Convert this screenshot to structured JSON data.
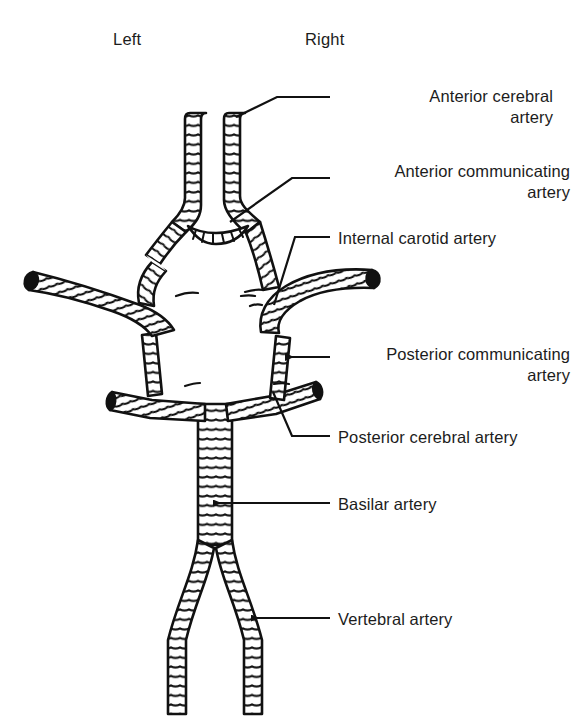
{
  "figure": {
    "title_visible": false,
    "orientation_labels": {
      "left": "Left",
      "right": "Right"
    },
    "ink_color": "#111111",
    "background_color": "#ffffff"
  },
  "callouts": [
    {
      "id": "anterior-cerebral-artery",
      "label": "Anterior cerebral\nartery",
      "lines": [
        "Anterior cerebral",
        "artery"
      ],
      "align": "right",
      "text_x": 338,
      "text_y": 86,
      "leader": {
        "type": "elbow",
        "points": "236,117 277,97 330,97"
      },
      "arrowhead": false
    },
    {
      "id": "anterior-communicating-artery",
      "label": "Anterior communicating\nartery",
      "lines": [
        "Anterior communicating",
        "artery"
      ],
      "align": "right",
      "text_x": 338,
      "text_y": 161,
      "leader": {
        "type": "elbow",
        "points": "230,222 292,178 330,178"
      },
      "arrowhead": false
    },
    {
      "id": "internal-carotid-artery",
      "label": "Internal carotid artery",
      "lines": [
        "Internal carotid artery"
      ],
      "align": "left",
      "text_x": 338,
      "text_y": 228,
      "leader": {
        "type": "elbow",
        "points": "274,305 295,237 330,237"
      },
      "arrowhead": false
    },
    {
      "id": "posterior-communicating-artery",
      "label": "Posterior communicating\nartery",
      "lines": [
        "Posterior communicating",
        "artery"
      ],
      "align": "right",
      "text_x": 338,
      "text_y": 344,
      "leader": {
        "type": "arrow",
        "points": "330,357 283,357"
      },
      "arrowhead": true
    },
    {
      "id": "posterior-cerebral-artery",
      "label": "Posterior cerebral artery",
      "lines": [
        "Posterior cerebral artery"
      ],
      "align": "left",
      "text_x": 338,
      "text_y": 427,
      "leader": {
        "type": "elbow",
        "points": "273,392 292,436 330,436"
      },
      "arrowhead": false
    },
    {
      "id": "basilar-artery",
      "label": "Basilar artery",
      "lines": [
        "Basilar artery"
      ],
      "align": "left",
      "text_x": 338,
      "text_y": 494,
      "leader": {
        "type": "arrow",
        "points": "330,503 211,503"
      },
      "arrowhead": true
    },
    {
      "id": "vertebral-artery",
      "label": "Vertebral artery",
      "lines": [
        "Vertebral artery"
      ],
      "align": "left",
      "text_x": 338,
      "text_y": 609,
      "leader": {
        "type": "arrow",
        "points": "330,618 249,618"
      },
      "arrowhead": true
    }
  ],
  "vessels": [
    {
      "id": "anterior-cerebral-artery-left",
      "name": "Left anterior cerebral artery",
      "cut_end": false
    },
    {
      "id": "anterior-cerebral-artery-right",
      "name": "Right anterior cerebral artery",
      "cut_end": false
    },
    {
      "id": "anterior-communicating-artery",
      "name": "Anterior communicating artery",
      "cut_end": false
    },
    {
      "id": "internal-carotid-artery-left",
      "name": "Left internal carotid artery",
      "cut_end": true
    },
    {
      "id": "internal-carotid-artery-right",
      "name": "Right internal carotid artery",
      "cut_end": true
    },
    {
      "id": "middle-cerebral-artery-left",
      "name": "Left middle cerebral artery",
      "cut_end": true
    },
    {
      "id": "posterior-communicating-artery-left",
      "name": "Left posterior communicating artery",
      "cut_end": false
    },
    {
      "id": "posterior-communicating-artery-right",
      "name": "Right posterior communicating artery",
      "cut_end": false
    },
    {
      "id": "posterior-cerebral-artery-left",
      "name": "Left posterior cerebral artery",
      "cut_end": true
    },
    {
      "id": "posterior-cerebral-artery-right",
      "name": "Right posterior cerebral artery",
      "cut_end": true
    },
    {
      "id": "basilar-artery",
      "name": "Basilar artery",
      "cut_end": false
    },
    {
      "id": "vertebral-artery-left",
      "name": "Left vertebral artery",
      "cut_end": false
    },
    {
      "id": "vertebral-artery-right",
      "name": "Right vertebral artery",
      "cut_end": false
    }
  ]
}
